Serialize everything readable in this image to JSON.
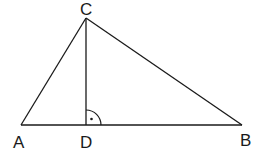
{
  "diagram": {
    "type": "geometry-triangle",
    "points": {
      "A": {
        "label": "A",
        "x": 21,
        "y": 125
      },
      "B": {
        "label": "B",
        "x": 242,
        "y": 125
      },
      "C": {
        "label": "C",
        "x": 86,
        "y": 18
      },
      "D": {
        "label": "D",
        "x": 86,
        "y": 125
      }
    },
    "segments": [
      {
        "from": "A",
        "to": "B"
      },
      {
        "from": "A",
        "to": "C"
      },
      {
        "from": "B",
        "to": "C"
      },
      {
        "from": "C",
        "to": "D"
      }
    ],
    "right_angle_marker": {
      "at": "D",
      "symbol": "arc-with-dot"
    },
    "labels": {
      "A": "A",
      "B": "B",
      "C": "C",
      "D": "D"
    },
    "colors": {
      "stroke": "#1a1a1a",
      "background": "#ffffff"
    }
  }
}
